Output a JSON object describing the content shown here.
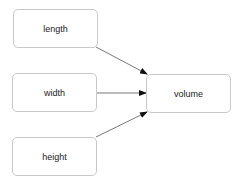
{
  "diagram": {
    "nodes": [
      {
        "id": "length",
        "label": "length"
      },
      {
        "id": "width",
        "label": "width"
      },
      {
        "id": "height",
        "label": "height"
      },
      {
        "id": "volume",
        "label": "volume"
      }
    ],
    "edges": [
      {
        "from": "length",
        "to": "volume"
      },
      {
        "from": "width",
        "to": "volume"
      },
      {
        "from": "height",
        "to": "volume"
      }
    ]
  }
}
